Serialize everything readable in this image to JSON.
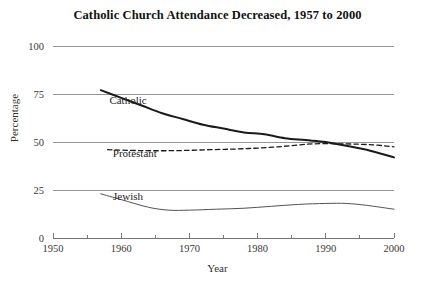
{
  "chart_data": {
    "type": "line",
    "title": "Catholic Church Attendance Decreased, 1957 to 2000",
    "xlabel": "Year",
    "ylabel": "Percentage",
    "xlim": [
      1950,
      2000
    ],
    "ylim": [
      0,
      100
    ],
    "xticks": [
      1950,
      1960,
      1970,
      1980,
      1990,
      2000
    ],
    "xtick_labels": [
      "1950",
      "1960",
      "1970",
      "1980",
      "1990",
      "2000"
    ],
    "xminor_ticks": [
      1955,
      1965,
      1975,
      1985,
      1995
    ],
    "yticks": [
      0,
      25,
      50,
      75,
      100
    ],
    "ytick_labels": [
      "0",
      "25",
      "50",
      "75",
      "100"
    ],
    "grid": "horizontal",
    "legend": "inline-labels",
    "series": [
      {
        "name": "Catholic",
        "style": "solid-thick",
        "color": "#1a1a1a",
        "width": 2.0,
        "label_x": 1961,
        "label_y": 70,
        "x": [
          1957,
          1960,
          1963,
          1966,
          1969,
          1972,
          1975,
          1978,
          1981,
          1984,
          1987,
          1990,
          1993,
          1996,
          2000
        ],
        "y": [
          77,
          73,
          69,
          65,
          62,
          59,
          57,
          55,
          54,
          52,
          51,
          50,
          48,
          46,
          42
        ]
      },
      {
        "name": "Protestant",
        "style": "dashed",
        "color": "#1a1a1a",
        "width": 1.3,
        "label_x": 1962,
        "label_y": 42,
        "x": [
          1958,
          1963,
          1968,
          1973,
          1978,
          1983,
          1988,
          1993,
          1997,
          2000
        ],
        "y": [
          46,
          45.5,
          45.5,
          46,
          46.5,
          47.5,
          49,
          49,
          48.5,
          47.5
        ]
      },
      {
        "name": "Jewish",
        "style": "solid-thin",
        "color": "#55524e",
        "width": 1.0,
        "label_x": 1961,
        "label_y": 20,
        "x": [
          1957,
          1960,
          1964,
          1967,
          1970,
          1974,
          1978,
          1982,
          1986,
          1990,
          1993,
          1996,
          2000
        ],
        "y": [
          23,
          20,
          16,
          14.5,
          14.5,
          15,
          15.5,
          16.5,
          17.5,
          18,
          18,
          17,
          15
        ]
      }
    ]
  }
}
